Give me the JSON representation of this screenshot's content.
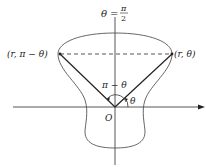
{
  "diagram": {
    "title_label": {
      "theta": "θ",
      "equals": "=",
      "numerator": "π",
      "denominator": "2"
    },
    "points": {
      "left": "(r, π − θ)",
      "right": "(r, θ)"
    },
    "angles": {
      "supplementary": "π − θ",
      "theta": "θ"
    },
    "origin_label": "O",
    "colors": {
      "stroke": "#333333",
      "curve": "#555555",
      "background": "#ffffff"
    }
  }
}
